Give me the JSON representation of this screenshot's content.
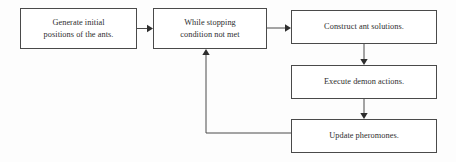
{
  "diagram": {
    "type": "flowchart",
    "background_color": "#fdfdfd",
    "box_border_color": "#4a4a4a",
    "box_fill_color": "#ffffff",
    "text_color": "#2e2e2e",
    "arrow_color": "#2e2e2e",
    "nodes": [
      {
        "id": "generate-initial-positions",
        "label": "Generate initial\npositions of the ants.",
        "x": 20,
        "y": 8,
        "width": 117,
        "height": 41
      },
      {
        "id": "while-stopping-condition",
        "label": "While stopping\ncondition not met",
        "x": 153,
        "y": 8,
        "width": 114,
        "height": 41
      },
      {
        "id": "construct-ant-solutions",
        "label": "Construct ant solutions.",
        "x": 291,
        "y": 10,
        "width": 146,
        "height": 34
      },
      {
        "id": "execute-demon-actions",
        "label": "Execute demon actions.",
        "x": 291,
        "y": 65,
        "width": 146,
        "height": 34
      },
      {
        "id": "update-pheromones",
        "label": "Update pheromones.",
        "x": 291,
        "y": 119,
        "width": 146,
        "height": 34
      }
    ],
    "edges": [
      {
        "id": "edge-generate-to-while",
        "from": "generate-initial-positions",
        "to": "while-stopping-condition",
        "kind": "straight-horizontal",
        "arrowhead": "right"
      },
      {
        "id": "edge-while-to-construct",
        "from": "while-stopping-condition",
        "to": "construct-ant-solutions",
        "kind": "straight-horizontal",
        "arrowhead": "right"
      },
      {
        "id": "edge-construct-to-execute",
        "from": "construct-ant-solutions",
        "to": "execute-demon-actions",
        "kind": "straight-vertical",
        "arrowhead": "down"
      },
      {
        "id": "edge-execute-to-update",
        "from": "execute-demon-actions",
        "to": "update-pheromones",
        "kind": "straight-vertical",
        "arrowhead": "down"
      },
      {
        "id": "edge-update-to-while-loopback",
        "from": "update-pheromones",
        "to": "while-stopping-condition",
        "kind": "elbow-loopback",
        "arrowhead": "up"
      }
    ]
  }
}
